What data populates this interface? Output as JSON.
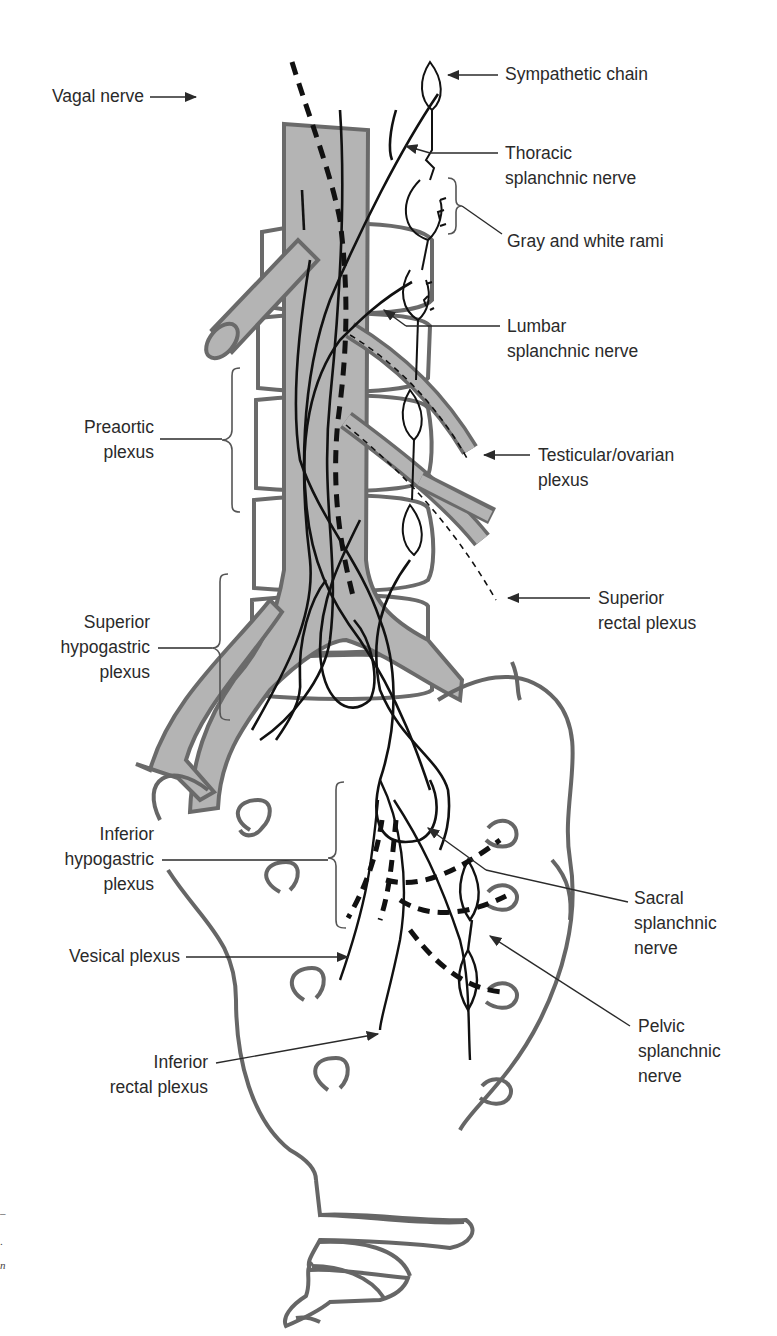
{
  "figure": {
    "colors": {
      "vessel_fill": "#b4b4b4",
      "vessel_outline": "#6a6a6a",
      "bone_outline": "#666666",
      "nerve": "#111111",
      "label_text": "#2a2a2a",
      "background": "#ffffff"
    }
  },
  "labels": {
    "sympathetic_chain": {
      "lines": [
        "Sympathetic chain"
      ]
    },
    "vagal_nerve": {
      "lines": [
        "Vagal nerve"
      ]
    },
    "thoracic_splanchnic": {
      "lines": [
        "Thoracic",
        "splanchnic nerve"
      ]
    },
    "gray_white_rami": {
      "lines": [
        "Gray and white rami"
      ]
    },
    "lumbar_splanchnic": {
      "lines": [
        "Lumbar",
        "splanchnic nerve"
      ]
    },
    "preaortic_plexus": {
      "lines": [
        "Preaortic",
        "plexus"
      ]
    },
    "testicular_ovarian": {
      "lines": [
        "Testicular/ovarian",
        "plexus"
      ]
    },
    "superior_rectal": {
      "lines": [
        "Superior",
        "rectal plexus"
      ]
    },
    "superior_hypogastric": {
      "lines": [
        "Superior",
        "hypogastric",
        "plexus"
      ]
    },
    "inferior_hypogastric": {
      "lines": [
        "Inferior",
        "hypogastric",
        "plexus"
      ]
    },
    "sacral_splanchnic": {
      "lines": [
        "Sacral",
        "splanchnic",
        "nerve"
      ]
    },
    "vesical_plexus": {
      "lines": [
        "Vesical plexus"
      ]
    },
    "pelvic_splanchnic": {
      "lines": [
        "Pelvic",
        "splanchnic",
        "nerve"
      ]
    },
    "inferior_rectal": {
      "lines": [
        "Inferior",
        "rectal plexus"
      ]
    }
  },
  "margin_marks": [
    "–",
    ".",
    "n"
  ]
}
